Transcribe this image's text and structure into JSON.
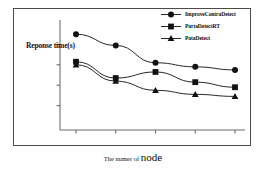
{
  "figure": {
    "background_color": "#ffffff",
    "frame_color": "#4a4a4a",
    "ink_color": "#111111"
  },
  "axis": {
    "y_label": "Reponse time(s)",
    "x_label_small": "The numer of ",
    "x_label_big": "node"
  },
  "legend": {
    "entries": [
      {
        "label": "ImproveContraDetect",
        "marker": "circle-marker",
        "color": "#111111"
      },
      {
        "label": "PartaDetectRT",
        "marker": "square-marker",
        "color": "#111111"
      },
      {
        "label": "PataDetect",
        "marker": "triangle-marker",
        "color": "#111111"
      }
    ]
  },
  "chart_data": {
    "type": "line",
    "title": "",
    "xlabel": "The numer of node",
    "ylabel": "Reponse time(s)",
    "x": [
      1,
      2,
      3,
      4,
      5
    ],
    "xlim": [
      0.5,
      5.5
    ],
    "ylim": [
      0,
      10
    ],
    "xticks": [
      1,
      2,
      3,
      4,
      5
    ],
    "xticklabels": [
      "",
      "",
      "",
      "",
      ""
    ],
    "yticks": [
      2,
      4,
      6,
      8
    ],
    "yticklabels": [
      "",
      "",
      "",
      ""
    ],
    "grid": false,
    "legend_position": "top-right",
    "series": [
      {
        "name": "ImproveContraDetect",
        "marker": "circle",
        "color": "#111111",
        "values": [
          9.0,
          7.9,
          6.2,
          5.8,
          5.5
        ]
      },
      {
        "name": "PartaDetectRT",
        "marker": "square",
        "color": "#111111",
        "values": [
          6.3,
          4.7,
          5.3,
          4.3,
          3.8
        ]
      },
      {
        "name": "PataDetect",
        "marker": "triangle",
        "color": "#111111",
        "values": [
          6.0,
          4.4,
          3.5,
          3.1,
          2.9
        ]
      }
    ]
  }
}
